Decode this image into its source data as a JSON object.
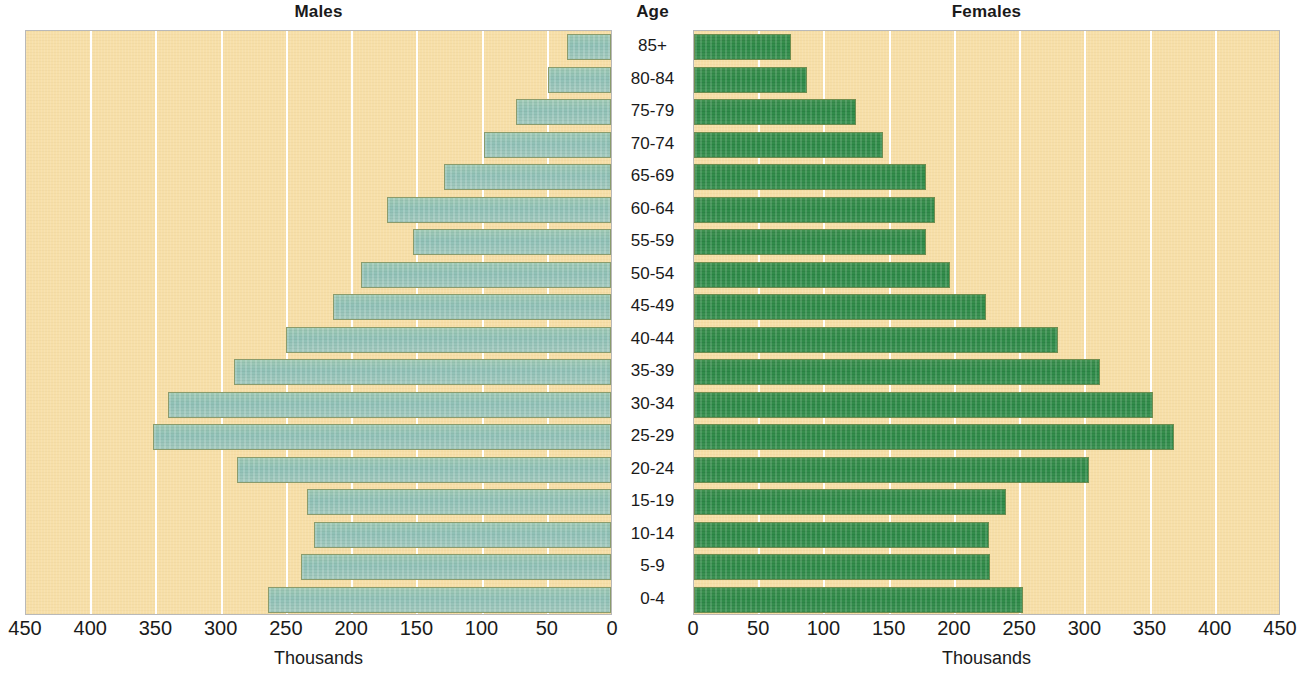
{
  "headers": {
    "males": "Males",
    "age": "Age",
    "females": "Females"
  },
  "axis_caption": "Thousands",
  "colors": {
    "panel_background": "#f7dfa8",
    "male_bar": "#8fc0b6",
    "female_bar": "#2f8b49",
    "gridline": "#ffffff",
    "text": "#1a1a1a"
  },
  "axes": {
    "male_ticks": [
      "450",
      "400",
      "350",
      "300",
      "250",
      "200",
      "150",
      "100",
      "50",
      "0"
    ],
    "female_ticks": [
      "0",
      "50",
      "100",
      "150",
      "200",
      "250",
      "300",
      "350",
      "400",
      "450"
    ],
    "max": 450,
    "tick_step": 50
  },
  "chart_data": {
    "type": "bar",
    "subtype": "population-pyramid",
    "title": "",
    "xlabel": "Thousands",
    "ylabel": "Age",
    "xlim": [
      0,
      450
    ],
    "grid": true,
    "legend": "none",
    "orientation": "horizontal",
    "categories": [
      "85+",
      "80-84",
      "75-79",
      "70-74",
      "65-69",
      "60-64",
      "55-59",
      "50-54",
      "45-49",
      "40-44",
      "35-39",
      "30-34",
      "25-29",
      "20-24",
      "15-19",
      "10-14",
      "5-9",
      "0-4"
    ],
    "series": [
      {
        "name": "Males",
        "side": "left",
        "values": [
          34,
          48,
          73,
          97,
          128,
          172,
          152,
          192,
          213,
          249,
          289,
          340,
          351,
          287,
          233,
          228,
          238,
          263
        ]
      },
      {
        "name": "Females",
        "side": "right",
        "values": [
          74,
          87,
          124,
          145,
          178,
          185,
          178,
          196,
          224,
          279,
          311,
          352,
          368,
          303,
          239,
          226,
          227,
          252
        ]
      }
    ]
  }
}
